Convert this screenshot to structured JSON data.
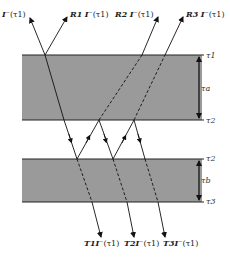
{
  "diagram": {
    "layers": [
      {
        "name": "upper-layer",
        "top_label": "τ1",
        "bottom_label": "τ2",
        "thickness_label": "τa",
        "color": "#9a9a9a"
      },
      {
        "name": "lower-layer",
        "top_label": "τ2",
        "bottom_label": "τ3",
        "thickness_label": "τb",
        "color": "#9a9a9a"
      }
    ],
    "incident": {
      "label": "I⁻(τ1)"
    },
    "reflected": [
      {
        "coef": "R1",
        "label": "I⁻(τ1)"
      },
      {
        "coef": "R2",
        "label": "I⁻(τ1)"
      },
      {
        "coef": "R3",
        "label": "I⁻(τ1)"
      }
    ],
    "transmitted": [
      {
        "coef": "T1",
        "label": "I⁻(τ1)"
      },
      {
        "coef": "T2",
        "label": "I⁻(τ1)"
      },
      {
        "coef": "T3",
        "label": "I⁻(τ1)"
      }
    ]
  }
}
